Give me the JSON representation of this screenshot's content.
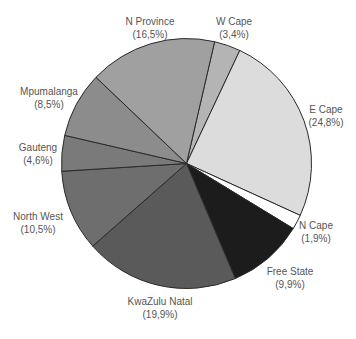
{
  "chart_data": {
    "type": "pie",
    "title": "",
    "start_angle_deg": 13,
    "direction": "clockwise",
    "decimal_separator": ",",
    "slices": [
      {
        "label": "W Cape",
        "value": 3.4,
        "value_text": "(3,4%)",
        "color": "#b4b4b4",
        "label_x": 234,
        "label_y": 16
      },
      {
        "label": "E Cape",
        "value": 24.8,
        "value_text": "(24,8%)",
        "color": "#dcdcdc",
        "label_x": 326,
        "label_y": 104
      },
      {
        "label": "N Cape",
        "value": 1.9,
        "value_text": "(1,9%)",
        "color": "#ffffff",
        "label_x": 316,
        "label_y": 220
      },
      {
        "label": "Free State",
        "value": 9.9,
        "value_text": "(9,9%)",
        "color": "#1c1c1c",
        "label_x": 290,
        "label_y": 266
      },
      {
        "label": "KwaZulu Natal",
        "value": 19.9,
        "value_text": "(19,9%)",
        "color": "#5a5a5a",
        "label_x": 160,
        "label_y": 296
      },
      {
        "label": "North West",
        "value": 10.5,
        "value_text": "(10,5%)",
        "color": "#6e6e6e",
        "label_x": 38,
        "label_y": 211
      },
      {
        "label": "Gauteng",
        "value": 4.6,
        "value_text": "(4,6%)",
        "color": "#7a7a7a",
        "label_x": 38,
        "label_y": 142
      },
      {
        "label": "Mpumalanga",
        "value": 8.5,
        "value_text": "(8,5%)",
        "color": "#8c8c8c",
        "label_x": 49,
        "label_y": 86
      },
      {
        "label": "N Province",
        "value": 16.5,
        "value_text": "(16,5%)",
        "color": "#a0a0a0",
        "label_x": 150,
        "label_y": 16
      }
    ],
    "legend": "none (direct labels)"
  },
  "layout": {
    "cx": 186.5,
    "cy": 163.5,
    "r": 125
  }
}
